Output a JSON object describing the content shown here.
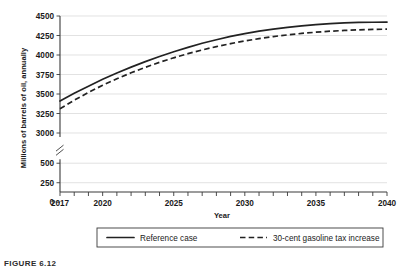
{
  "figure": {
    "caption": "FIGURE 6.12"
  },
  "chart_data": {
    "type": "line",
    "title": "",
    "xlabel": "Year",
    "ylabel": "Millions of barrels of oil, annually",
    "x": [
      2017,
      2018,
      2019,
      2020,
      2021,
      2022,
      2023,
      2024,
      2025,
      2026,
      2027,
      2028,
      2029,
      2030,
      2031,
      2032,
      2033,
      2034,
      2035,
      2036,
      2037,
      2038,
      2039,
      2040
    ],
    "xlim": [
      2017,
      2040
    ],
    "xticks": [
      2017,
      2018,
      2019,
      2020,
      2021,
      2022,
      2023,
      2024,
      2025,
      2026,
      2027,
      2028,
      2029,
      2030,
      2031,
      2032,
      2033,
      2034,
      2035,
      2036,
      2037,
      2038,
      2039,
      2040
    ],
    "xtick_labels": [
      "2017",
      "2020",
      "2025",
      "2030",
      "2035",
      "2040"
    ],
    "xtick_label_values": [
      2017,
      2020,
      2025,
      2030,
      2035,
      2040
    ],
    "yticks": [
      0,
      250,
      500,
      3000,
      3250,
      3500,
      3750,
      4000,
      4250,
      4500
    ],
    "ytick_labels": [
      "0",
      "250",
      "500",
      "3000",
      "3250",
      "3500",
      "3750",
      "4000",
      "4250",
      "4500"
    ],
    "ylim": [
      0,
      4500
    ],
    "axis_break": {
      "present": true,
      "between": [
        500,
        3000
      ],
      "marker": "double-slash"
    },
    "grid": "horizontal",
    "legend_position": "below-plot",
    "series": [
      {
        "name": "Reference case",
        "style": "solid",
        "color": "#222222",
        "values": [
          3410,
          3510,
          3600,
          3690,
          3770,
          3845,
          3915,
          3980,
          4042,
          4098,
          4150,
          4196,
          4238,
          4274,
          4305,
          4332,
          4355,
          4374,
          4390,
          4402,
          4411,
          4417,
          4420,
          4422
        ]
      },
      {
        "name": "30-cent gasoline tax increase",
        "style": "dashed",
        "color": "#222222",
        "values": [
          3310,
          3420,
          3520,
          3612,
          3695,
          3772,
          3842,
          3906,
          3964,
          4017,
          4065,
          4108,
          4146,
          4180,
          4210,
          4236,
          4258,
          4277,
          4292,
          4305,
          4315,
          4323,
          4328,
          4331
        ]
      }
    ]
  },
  "legend": {
    "items": [
      {
        "label": "Reference case",
        "style": "solid"
      },
      {
        "label": "30-cent gasoline tax increase",
        "style": "dashed"
      }
    ]
  }
}
